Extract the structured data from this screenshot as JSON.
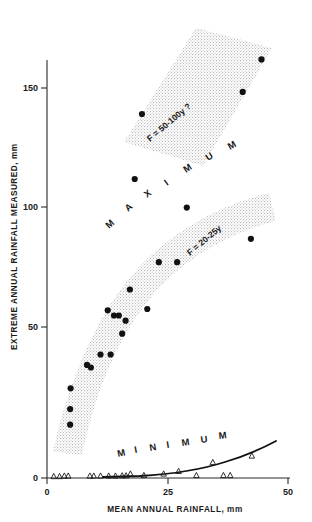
{
  "chart_data": {
    "type": "scatter",
    "title": "",
    "xlabel": "MEAN ANNUAL RAINFALL, mm",
    "ylabel": "EXTREME ANNUAL RAINFALL MEASURED, mm",
    "xlim": [
      0,
      50
    ],
    "ylim": [
      0,
      172
    ],
    "xticks": [
      0,
      25,
      50
    ],
    "xtick_labels": [
      "0",
      "25",
      "50"
    ],
    "yticks": [
      0,
      50,
      100,
      150
    ],
    "ytick_labels": [
      "0",
      "50",
      "100",
      "150"
    ],
    "grid": false,
    "legend": "none",
    "series": [
      {
        "name": "MAXIMUM",
        "marker": "filled-circle",
        "points": [
          {
            "x": 4.8,
            "y": 20.5
          },
          {
            "x": 4.8,
            "y": 26.5
          },
          {
            "x": 4.9,
            "y": 34.5
          },
          {
            "x": 8.3,
            "y": 43.5
          },
          {
            "x": 9.1,
            "y": 42.5
          },
          {
            "x": 11.1,
            "y": 47.5
          },
          {
            "x": 13.2,
            "y": 47.5
          },
          {
            "x": 12.6,
            "y": 64.5
          },
          {
            "x": 13.9,
            "y": 62.5
          },
          {
            "x": 14.9,
            "y": 62.5
          },
          {
            "x": 15.6,
            "y": 55.5
          },
          {
            "x": 16.3,
            "y": 60.5
          },
          {
            "x": 17.2,
            "y": 72.5
          },
          {
            "x": 20.8,
            "y": 65.0
          },
          {
            "x": 23.2,
            "y": 83.0
          },
          {
            "x": 27.0,
            "y": 83.0
          },
          {
            "x": 29.0,
            "y": 104.0
          },
          {
            "x": 42.3,
            "y": 92.0
          },
          {
            "x": 18.2,
            "y": 115.0
          },
          {
            "x": 19.7,
            "y": 140.0
          },
          {
            "x": 40.6,
            "y": 148.5
          },
          {
            "x": 44.5,
            "y": 161.0
          }
        ]
      },
      {
        "name": "MINIMUM",
        "marker": "open-triangle",
        "points": [
          {
            "x": 1.4,
            "y": 0.6
          },
          {
            "x": 2.6,
            "y": 0.6
          },
          {
            "x": 3.6,
            "y": 0.8
          },
          {
            "x": 4.4,
            "y": 0.8
          },
          {
            "x": 8.9,
            "y": 0.8
          },
          {
            "x": 9.7,
            "y": 0.8
          },
          {
            "x": 11.1,
            "y": 0.8
          },
          {
            "x": 12.8,
            "y": 0.8
          },
          {
            "x": 14.2,
            "y": 0.8
          },
          {
            "x": 15.6,
            "y": 0.9
          },
          {
            "x": 16.4,
            "y": 0.9
          },
          {
            "x": 17.3,
            "y": 1.6
          },
          {
            "x": 20.1,
            "y": 1.0
          },
          {
            "x": 24.2,
            "y": 1.6
          },
          {
            "x": 27.3,
            "y": 2.6
          },
          {
            "x": 31.0,
            "y": 1.0
          },
          {
            "x": 34.4,
            "y": 6.0
          },
          {
            "x": 36.6,
            "y": 1.0
          },
          {
            "x": 38.0,
            "y": 1.0
          },
          {
            "x": 42.5,
            "y": 8.5
          }
        ]
      }
    ],
    "bands": [
      {
        "name": "upper-band",
        "label": "F = 50-100y ?",
        "shading": "stippled"
      },
      {
        "name": "lower-band",
        "label": "F = 20-25y",
        "shading": "stippled"
      }
    ],
    "annotations": [
      {
        "name": "maximum-region-label",
        "text": "M A X I M U M"
      },
      {
        "name": "minimum-region-label",
        "text": "M I N I M U M"
      },
      {
        "name": "upper-band-label",
        "text": "F = 50-100y ?"
      },
      {
        "name": "lower-band-label",
        "text": "F = 20-25y"
      }
    ],
    "curves": [
      {
        "name": "minimum-envelope-curve",
        "style": "solid"
      }
    ]
  },
  "axes": {
    "y_title": "EXTREME ANNUAL RAINFALL MEASURED, mm",
    "x_title": "MEAN ANNUAL RAINFALL, mm",
    "y_tick_0": "0",
    "y_tick_50": "50",
    "y_tick_100": "100",
    "y_tick_150": "150",
    "x_tick_0": "0",
    "x_tick_25": "25",
    "x_tick_50": "50"
  },
  "labels": {
    "maximum_letters": [
      "M",
      "A",
      "X",
      "I",
      "M",
      "U",
      "M"
    ],
    "minimum_letters": [
      "M",
      "I",
      "N",
      "I",
      "M",
      "U",
      "M"
    ],
    "upper_band": "F = 50-100y ?",
    "lower_band": "F = 20-25y"
  },
  "colors": {
    "ink": "#111111",
    "axis": "#2a2a2a",
    "band_fill": "#e8e8e8"
  }
}
